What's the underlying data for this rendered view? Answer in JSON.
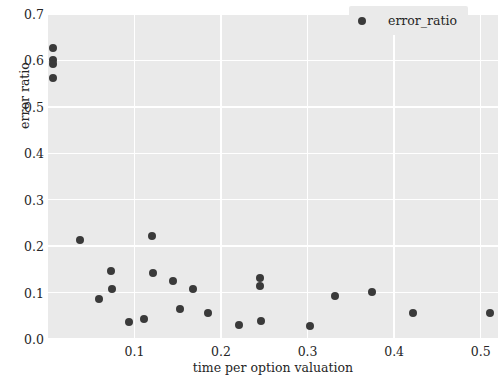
{
  "chart_data": {
    "type": "scatter",
    "title": "",
    "xlabel": "time per option valuation",
    "ylabel": "error ratio",
    "xlim": [
      0.0,
      0.52
    ],
    "ylim": [
      0.0,
      0.7
    ],
    "xticks": [
      0.1,
      0.2,
      0.3,
      0.4,
      0.5
    ],
    "xticklabels": [
      "0.1",
      "0.2",
      "0.3",
      "0.4",
      "0.5"
    ],
    "yticks": [
      0.0,
      0.1,
      0.2,
      0.3,
      0.4,
      0.5,
      0.6,
      0.7
    ],
    "yticklabels": [
      "0.0",
      "0.1",
      "0.2",
      "0.3",
      "0.4",
      "0.5",
      "0.6",
      "0.7"
    ],
    "grid": true,
    "grid_color": "#ffffff",
    "panel_color": "#eaeaea",
    "marker_color": "#3a3a3a",
    "legend_position": "upper right",
    "series": [
      {
        "name": "error_ratio",
        "points": [
          [
            0.006,
            0.627
          ],
          [
            0.006,
            0.601
          ],
          [
            0.006,
            0.592
          ],
          [
            0.006,
            0.562
          ],
          [
            0.037,
            0.213
          ],
          [
            0.059,
            0.087
          ],
          [
            0.073,
            0.147
          ],
          [
            0.074,
            0.107
          ],
          [
            0.094,
            0.037
          ],
          [
            0.111,
            0.044
          ],
          [
            0.12,
            0.221
          ],
          [
            0.121,
            0.142
          ],
          [
            0.144,
            0.124
          ],
          [
            0.152,
            0.065
          ],
          [
            0.168,
            0.108
          ],
          [
            0.185,
            0.057
          ],
          [
            0.221,
            0.03
          ],
          [
            0.245,
            0.131
          ],
          [
            0.245,
            0.115
          ],
          [
            0.246,
            0.038
          ],
          [
            0.303,
            0.028
          ],
          [
            0.332,
            0.093
          ],
          [
            0.374,
            0.102
          ],
          [
            0.422,
            0.055
          ],
          [
            0.511,
            0.055
          ]
        ]
      }
    ]
  },
  "legend": {
    "entries": [
      {
        "label": "error_ratio",
        "marker": "circle-marker"
      }
    ]
  }
}
